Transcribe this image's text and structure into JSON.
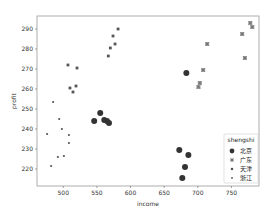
{
  "chart_data": {
    "type": "scatter",
    "title": "",
    "xlabel": "income",
    "ylabel": "profit",
    "xlim": [
      461,
      791
    ],
    "ylim": [
      211.5,
      296.5
    ],
    "xticks": [
      500,
      550,
      600,
      650,
      700,
      750
    ],
    "yticks": [
      220,
      230,
      240,
      250,
      260,
      270,
      280,
      290
    ],
    "grid": false,
    "legend": {
      "title": "shengshi",
      "position": "lower right",
      "entries": [
        "北京",
        "广东",
        "天津",
        "浙江"
      ]
    },
    "series": [
      {
        "name": "北京",
        "marker": "circle-large",
        "color": "#333333",
        "points": [
          [
            546,
            244
          ],
          [
            555,
            248
          ],
          [
            561,
            244.5
          ],
          [
            565,
            244
          ],
          [
            568,
            243
          ],
          [
            683,
            268
          ],
          [
            672.5,
            229.5
          ],
          [
            686,
            227
          ],
          [
            681,
            221
          ],
          [
            677,
            215.5
          ]
        ]
      },
      {
        "name": "广东",
        "marker": "x-square",
        "color": "#777777",
        "points": [
          [
            778,
            293
          ],
          [
            781,
            291
          ],
          [
            766,
            287.5
          ],
          [
            714,
            282.5
          ],
          [
            770,
            275.5
          ],
          [
            708,
            269.5
          ],
          [
            703,
            263
          ],
          [
            701,
            261
          ]
        ]
      },
      {
        "name": "天津",
        "marker": "x-small",
        "color": "#555555",
        "points": [
          [
            581.5,
            290
          ],
          [
            574,
            286.5
          ],
          [
            577,
            282.5
          ],
          [
            570,
            280.5
          ],
          [
            567,
            276.5
          ],
          [
            507,
            272
          ],
          [
            520.5,
            270.5
          ],
          [
            510,
            260.5
          ],
          [
            519,
            261.5
          ],
          [
            514.5,
            258.5
          ]
        ]
      },
      {
        "name": "浙江",
        "marker": "dot-small",
        "color": "#555555",
        "points": [
          [
            485,
            253.5
          ],
          [
            494,
            245
          ],
          [
            498,
            240
          ],
          [
            476,
            237.5
          ],
          [
            508.5,
            237
          ],
          [
            508.5,
            233
          ],
          [
            492,
            226
          ],
          [
            501,
            226.5
          ],
          [
            482,
            221.5
          ]
        ]
      }
    ]
  }
}
